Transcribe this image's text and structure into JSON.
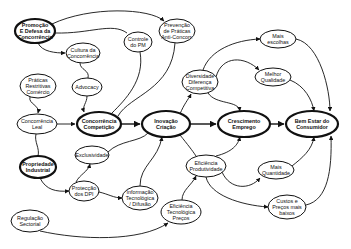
{
  "diagram": {
    "title": "",
    "nodes": {
      "promocao": {
        "lines": [
          "Promoção",
          "E Defesa da",
          "Concorrência"
        ],
        "x": 35,
        "y": 31,
        "rx": 20,
        "ry": 12,
        "bold": true
      },
      "cultura": {
        "lines": [
          "Cultura da",
          "Concorrência"
        ],
        "x": 83,
        "y": 53,
        "rx": 17,
        "ry": 10,
        "bold": false
      },
      "controle": {
        "lines": [
          "Controle",
          "do PM"
        ],
        "x": 138,
        "y": 42,
        "rx": 14,
        "ry": 10,
        "bold": false
      },
      "prevencao": {
        "lines": [
          "Prevenção",
          "de Práticas",
          "Anti-Concorr."
        ],
        "x": 177,
        "y": 31,
        "rx": 18,
        "ry": 12,
        "bold": false
      },
      "praticas": {
        "lines": [
          "Práticas",
          "Restritivas",
          "Comércio"
        ],
        "x": 38,
        "y": 86,
        "rx": 18,
        "ry": 12,
        "bold": false
      },
      "advocacy": {
        "lines": [
          "Advocacy"
        ],
        "x": 87,
        "y": 87,
        "rx": 15,
        "ry": 9,
        "bold": false
      },
      "concleal": {
        "lines": [
          "Concorrência",
          "Leal"
        ],
        "x": 37,
        "y": 124,
        "rx": 20,
        "ry": 10,
        "bold": false
      },
      "conccomp": {
        "lines": [
          "Concorrência",
          "Competição"
        ],
        "x": 99,
        "y": 124,
        "rx": 22,
        "ry": 12,
        "bold": true
      },
      "inovacao": {
        "lines": [
          "Inovação",
          "Criação"
        ],
        "x": 166,
        "y": 124,
        "rx": 24,
        "ry": 13,
        "bold": true
      },
      "crescimento": {
        "lines": [
          "Crescimento",
          "Emprego"
        ],
        "x": 244,
        "y": 124,
        "rx": 26,
        "ry": 13,
        "bold": true
      },
      "bemestar": {
        "lines": [
          "Bem Estar do",
          "Consumidor"
        ],
        "x": 312,
        "y": 124,
        "rx": 26,
        "ry": 13,
        "bold": true
      },
      "diversidade": {
        "lines": [
          "Diversidade",
          "Diferença",
          "Competitiva"
        ],
        "x": 200,
        "y": 82,
        "rx": 18,
        "ry": 12,
        "bold": false
      },
      "maisescolhas": {
        "lines": [
          "Mais",
          "escolhas"
        ],
        "x": 278,
        "y": 39,
        "rx": 18,
        "ry": 9,
        "bold": false
      },
      "melhorqual": {
        "lines": [
          "Melhor",
          "Qualidade"
        ],
        "x": 273,
        "y": 77,
        "rx": 18,
        "ry": 9,
        "bold": false
      },
      "eficprod": {
        "lines": [
          "Eficiência",
          "Produtividade"
        ],
        "x": 206,
        "y": 166,
        "rx": 20,
        "ry": 11,
        "bold": false
      },
      "maisquant": {
        "lines": [
          "Mais",
          "Quantidade"
        ],
        "x": 276,
        "y": 170,
        "rx": 18,
        "ry": 9,
        "bold": false
      },
      "custos": {
        "lines": [
          "Custos e",
          "Preços mais",
          "baixos"
        ],
        "x": 287,
        "y": 207,
        "rx": 19,
        "ry": 12,
        "bold": false
      },
      "exclusividade": {
        "lines": [
          "Exclusividade"
        ],
        "x": 92,
        "y": 155,
        "rx": 17,
        "ry": 9,
        "bold": false
      },
      "propriedade": {
        "lines": [
          "Propriedade",
          "Industrial"
        ],
        "x": 38,
        "y": 167,
        "rx": 18,
        "ry": 11,
        "bold": true
      },
      "proteccao": {
        "lines": [
          "Protecção",
          "dos DPI"
        ],
        "x": 84,
        "y": 191,
        "rx": 15,
        "ry": 10,
        "bold": false
      },
      "informacao": {
        "lines": [
          "Informação",
          "Tecnológica",
          "/ Difusão"
        ],
        "x": 140,
        "y": 198,
        "rx": 18,
        "ry": 12,
        "bold": false
      },
      "efictec": {
        "lines": [
          "Eficiência",
          "Tecnológica",
          "Preços"
        ],
        "x": 181,
        "y": 212,
        "rx": 20,
        "ry": 12,
        "bold": false
      },
      "regulacao": {
        "lines": [
          "Regulação",
          "Sectorial"
        ],
        "x": 30,
        "y": 221,
        "rx": 19,
        "ry": 11,
        "bold": false
      }
    }
  }
}
